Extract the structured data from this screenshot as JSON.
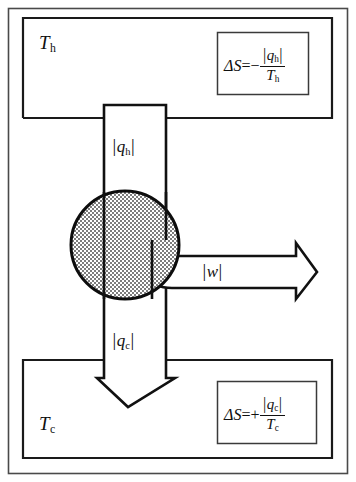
{
  "diagram": {
    "type": "thermodynamic-schematic",
    "colors": {
      "background": "#ffffff",
      "stroke": "#111111",
      "frame": "#4a4a4a",
      "stipple_fill": "#a8a8a8"
    }
  },
  "hot_reservoir": {
    "name": "hot-reservoir",
    "temperature_label": "T",
    "temperature_subscript": "h",
    "entropy": {
      "lead": "ΔS",
      "equals": "=",
      "sign": "−",
      "numerator_var": "q",
      "numerator_sub": "h",
      "denominator_var": "T",
      "denominator_sub": "h"
    }
  },
  "cold_reservoir": {
    "name": "cold-reservoir",
    "temperature_label": "T",
    "temperature_subscript": "c",
    "entropy": {
      "lead": "ΔS",
      "equals": "=",
      "sign": "+",
      "numerator_var": "q",
      "numerator_sub": "c",
      "denominator_var": "T",
      "denominator_sub": "c"
    }
  },
  "heat_in": {
    "name": "heat-absorbed-arrow",
    "var": "q",
    "sub": "h",
    "direction": "down"
  },
  "heat_out": {
    "name": "heat-rejected-arrow",
    "var": "q",
    "sub": "c",
    "direction": "down"
  },
  "work": {
    "name": "work-output-arrow",
    "var": "w",
    "sub": "",
    "direction": "right"
  },
  "engine": {
    "name": "engine-circle",
    "fill_pattern": "stipple"
  },
  "glyphs": {
    "abs_bar": "|"
  }
}
